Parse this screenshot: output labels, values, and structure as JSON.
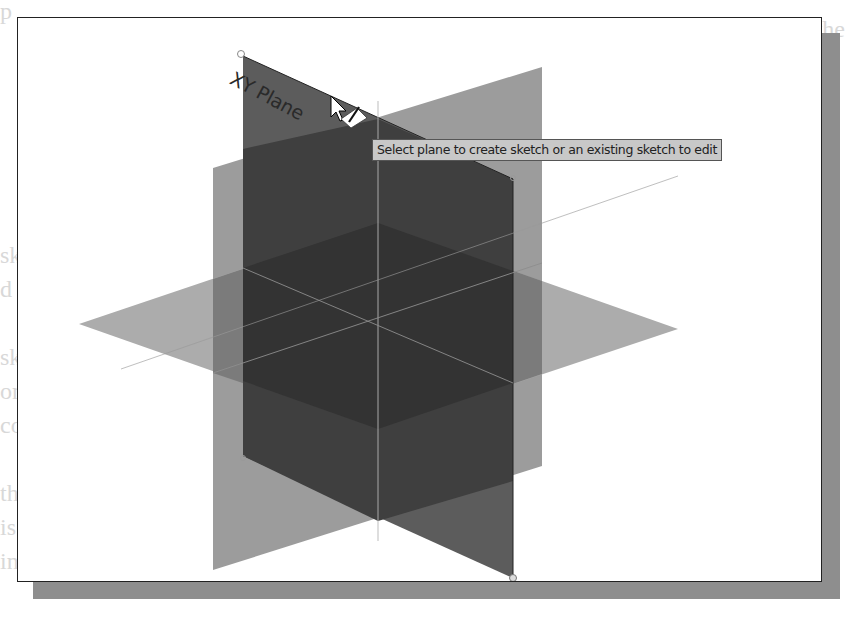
{
  "viewport": {
    "planes": [
      {
        "name": "XY Plane",
        "label": "XY Plane",
        "state": "highlighted"
      },
      {
        "name": "YZ Plane",
        "label": ""
      },
      {
        "name": "XZ Plane",
        "label": ""
      }
    ],
    "origin": {
      "x": 377,
      "y": 320
    }
  },
  "tooltip": {
    "text": "Select plane to create sketch or an existing sketch to edit"
  },
  "cursor": {
    "type": "arrow-with-sketch-pencil"
  },
  "colors": {
    "frame_border": "#222222",
    "shadow": "#8e8e8e",
    "xy_plane": "#5a5a5a",
    "yz_plane": "#9a9a9a",
    "xz_plane": "#a8a8a8",
    "overlap_dark": "#3a3a3a",
    "tooltip_bg": "#c8c8c8"
  }
}
